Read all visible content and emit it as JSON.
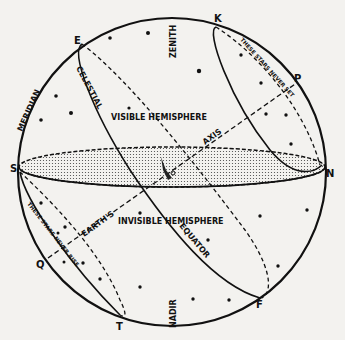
{
  "diagram": {
    "colors": {
      "background": "#f3f2ef",
      "ink": "#111111",
      "stipple": "#9a9a9a"
    },
    "points": {
      "E": "E",
      "K": "K",
      "P": "P",
      "S": "S",
      "N": "N",
      "Q": "Q",
      "T": "T",
      "F": "F"
    },
    "labels": {
      "zenith": "ZENITH",
      "nadir": "NADIR",
      "meridian": "MERIDIAN",
      "celestial": "CELESTIAL",
      "equator": "EQUATOR",
      "visible_hemisphere": "VISIBLE  HEMISPHERE",
      "invisible_hemisphere": "INVISIBLE  HEMISPHERE",
      "earths": "EARTH'S",
      "axis": "AXIS",
      "never_set": "THESE  STARS  NEVER  SET",
      "never_rise": "THESE  STARS  NEVER  RISE"
    }
  }
}
